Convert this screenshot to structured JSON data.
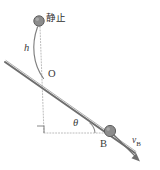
{
  "figure": {
    "type": "physics-diagram",
    "labels": {
      "rest": "静止",
      "height": "h",
      "origin": "O",
      "angle": "θ",
      "point_b": "B",
      "velocity": "v",
      "velocity_subscript": "B"
    },
    "colors": {
      "incline": "#6e6e6e",
      "ball": "#8c8c8c",
      "ball_stroke": "#5f5f5f",
      "dotted": "#b0b0b0",
      "arc": "#7a7a7a",
      "arrow": "#6e6e6e",
      "text": "#3a3a3a",
      "background": "#ffffff"
    },
    "elements": {
      "ball_top": "ball-at-rest",
      "ball_b": "ball-b",
      "incline_line": "inclined-plane",
      "drop_arc": "fall-trajectory-arc",
      "vertical_dotted": "vertical-reference-line",
      "horizontal_dotted": "horizontal-reference-line",
      "right_angle_marker": "right-angle-marker",
      "angle_arc": "theta-angle-arc",
      "velocity_arrow": "velocity-vector-arrow"
    },
    "geometry": {
      "ball_top_center": [
        39,
        21
      ],
      "ball_top_radius": 5.2,
      "point_o": [
        44,
        79
      ],
      "ball_b_center": [
        110,
        131
      ],
      "ball_b_radius": 5.6,
      "incline_start": [
        5,
        62
      ],
      "incline_end": [
        133,
        152
      ],
      "corner": [
        44,
        133
      ],
      "horizontal_end": [
        110,
        133
      ],
      "arrow_tip": [
        139,
        161
      ]
    }
  }
}
